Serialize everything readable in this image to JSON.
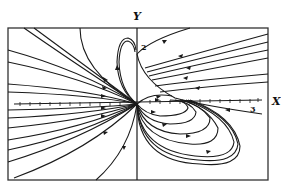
{
  "figure": {
    "type": "phase portrait",
    "x_axis_label": "X",
    "y_axis_label": "Y",
    "x_tick_label": "3",
    "y_tick_label": "2",
    "colors": {
      "ink": "#1a1a1a",
      "background": "#ffffff"
    }
  }
}
